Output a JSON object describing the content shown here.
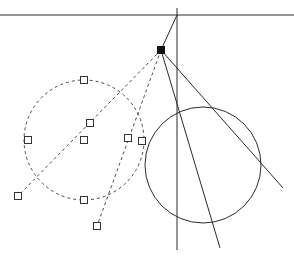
{
  "drawing": {
    "background": "#ffffff",
    "colors": {
      "solid_line": "#2a2a2a",
      "dashed_line": "#4a4a4a",
      "handle_stroke": "#333333",
      "handle_fill": "#ffffff",
      "anchor_fill": "#111111"
    },
    "solid_lines": [
      {
        "name": "horizontal-axis-line",
        "x1": 0,
        "y1": 15,
        "x2": 294,
        "y2": 15
      },
      {
        "name": "vertical-axis-line",
        "x1": 177,
        "y1": 8,
        "x2": 177,
        "y2": 250
      },
      {
        "name": "axis-to-anchor-line",
        "x1": 177,
        "y1": 15,
        "x2": 161,
        "y2": 50
      },
      {
        "name": "anchor-to-lower-line",
        "x1": 161,
        "y1": 50,
        "x2": 220,
        "y2": 248
      },
      {
        "name": "anchor-to-right-line",
        "x1": 161,
        "y1": 50,
        "x2": 283,
        "y2": 188
      }
    ],
    "solid_circles": [
      {
        "name": "solid-circle",
        "cx": 203,
        "cy": 165,
        "r": 58
      }
    ],
    "dashed_circles": [
      {
        "name": "dashed-circle",
        "cx": 84,
        "cy": 140,
        "r": 60
      }
    ],
    "dashed_lines": [
      {
        "name": "dashed-line-left",
        "x1": 161,
        "y1": 50,
        "x2": 18,
        "y2": 196
      },
      {
        "name": "dashed-line-lower",
        "x1": 161,
        "y1": 50,
        "x2": 97,
        "y2": 226
      }
    ],
    "anchor_point": {
      "name": "anchor-point",
      "x": 161,
      "y": 50
    },
    "handles": [
      {
        "name": "circle-top-handle",
        "x": 84,
        "y": 80
      },
      {
        "name": "circle-left-handle",
        "x": 28,
        "y": 140
      },
      {
        "name": "circle-bottom-handle",
        "x": 84,
        "y": 200
      },
      {
        "name": "circle-right-handle",
        "x": 142,
        "y": 141
      },
      {
        "name": "circle-center-handle",
        "x": 84,
        "y": 140
      },
      {
        "name": "line-mid-handle",
        "x": 90,
        "y": 123
      },
      {
        "name": "line-left-end-handle",
        "x": 18,
        "y": 196
      },
      {
        "name": "line2-mid-handle",
        "x": 128,
        "y": 138
      },
      {
        "name": "line2-end-handle",
        "x": 97,
        "y": 226
      }
    ]
  }
}
